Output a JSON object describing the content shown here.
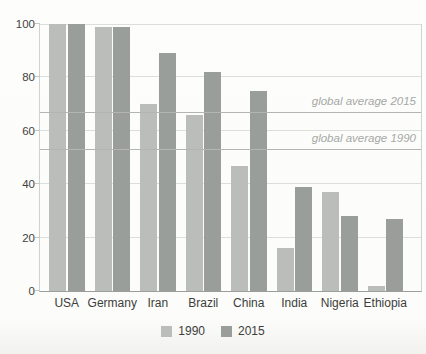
{
  "chart_data": {
    "type": "bar",
    "title": "",
    "xlabel": "",
    "ylabel": "",
    "categories": [
      "USA",
      "Germany",
      "Iran",
      "Brazil",
      "China",
      "India",
      "Nigeria",
      "Ethiopia"
    ],
    "series": [
      {
        "name": "1990",
        "color": "#babdba",
        "values": [
          100,
          99,
          70,
          66,
          47,
          16,
          37,
          2
        ]
      },
      {
        "name": "2015",
        "color": "#9a9e9b",
        "values": [
          100,
          99,
          89,
          82,
          75,
          39,
          28,
          27
        ]
      }
    ],
    "ylim": [
      0,
      100
    ],
    "yticks": [
      0,
      20,
      40,
      60,
      80,
      100
    ],
    "grid": true,
    "legend_position": "bottom",
    "reference_lines": [
      {
        "label": "global average 2015",
        "value": 67,
        "color": "#b2b5b2"
      },
      {
        "label": "global average 1990",
        "value": 53,
        "color": "#b2b5b2"
      }
    ]
  },
  "colors": {
    "background": "#fcfcfa",
    "gridline": "#dcdedc",
    "axis": "#9b9e9b",
    "tick_text": "#414341",
    "category_text": "#3c3e3c",
    "reference_text": "#a5a8a5"
  }
}
